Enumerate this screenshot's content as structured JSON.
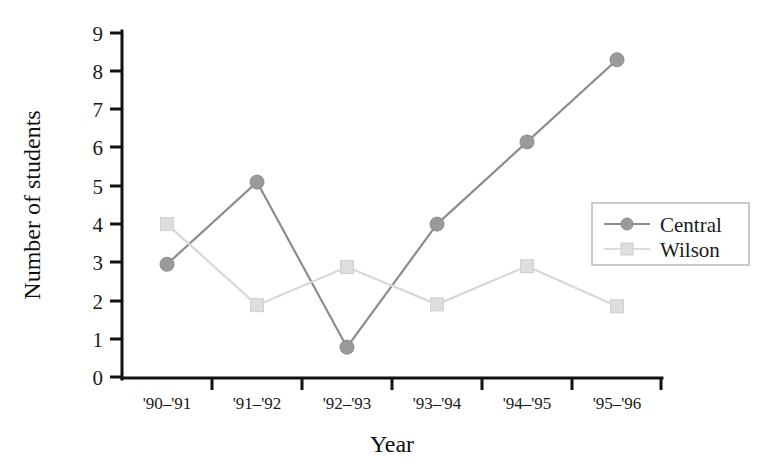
{
  "chart_data": {
    "type": "line",
    "title": "",
    "xlabel": "Year",
    "ylabel": "Number of students",
    "categories": [
      "'90–'91",
      "'91–'92",
      "'92–'93",
      "'93–'94",
      "'94–'95",
      "'95–'96"
    ],
    "series": [
      {
        "name": "Central",
        "values": [
          2.95,
          5.1,
          0.78,
          4.0,
          6.15,
          8.3
        ],
        "color": "#8c8c8c",
        "marker": "circle"
      },
      {
        "name": "Wilson",
        "values": [
          4.0,
          1.88,
          2.88,
          1.9,
          2.9,
          1.85
        ],
        "color": "#d8d8d8",
        "marker": "square"
      }
    ],
    "ylim": [
      0,
      9
    ],
    "yticks": [
      0,
      1,
      2,
      3,
      4,
      5,
      6,
      7,
      8,
      9
    ],
    "ytick_labels": [
      "0",
      "1",
      "2",
      "3",
      "4",
      "5",
      "6",
      "7",
      "8",
      "9"
    ],
    "grid": false,
    "legend_position": "right"
  },
  "axes": {
    "y_title": "Number of students",
    "x_title": "Year"
  },
  "legend": {
    "entries": [
      {
        "label": "Central"
      },
      {
        "label": "Wilson"
      }
    ]
  }
}
